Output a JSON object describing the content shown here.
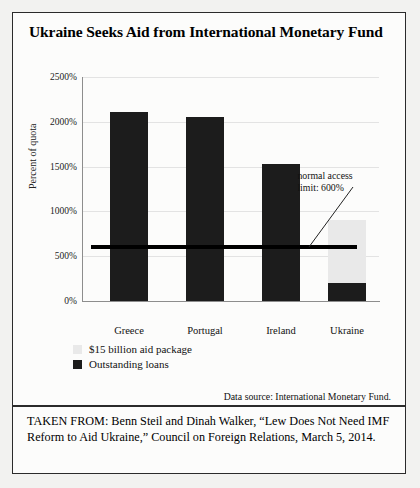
{
  "figure": {
    "title": "Ukraine Seeks Aid from International Monetary Fund",
    "data_source": "Data source: International Monetary Fund.",
    "footer": "TAKEN FROM: Benn Steil and Dinah Walker, “Lew Does Not Need IMF Reform to Aid Ukraine,” Council on Foreign Relations, March 5, 2014."
  },
  "annotation": {
    "line1": "normal access",
    "line2": "limit: 600%"
  },
  "legend": {
    "items": [
      {
        "label": "$15 billion aid package",
        "color": "#e9e9e9",
        "key": "aid"
      },
      {
        "label": "Outstanding loans",
        "color": "#1c1c1c",
        "key": "loans"
      }
    ]
  },
  "chart_data": {
    "type": "bar",
    "stacked": true,
    "title": "Ukraine Seeks Aid from International Monetary Fund",
    "xlabel": "",
    "ylabel": "Percent of quota",
    "ylim": [
      0,
      2500
    ],
    "yticks": [
      0,
      500,
      1000,
      1500,
      2000,
      2500
    ],
    "ytick_labels": [
      "0%",
      "500%",
      "1000%",
      "1500%",
      "2000%",
      "2500%"
    ],
    "grid": true,
    "legend_position": "below-left",
    "categories": [
      "Greece",
      "Portugal",
      "Ireland",
      "Ukraine"
    ],
    "series": [
      {
        "name": "Outstanding loans",
        "color": "#1c1c1c",
        "values": [
          2110,
          2050,
          1530,
          200
        ]
      },
      {
        "name": "$15 billion aid package",
        "color": "#e9e9e9",
        "values": [
          0,
          0,
          0,
          700
        ]
      }
    ],
    "reference_line": {
      "label": "normal access limit: 600%",
      "value": 600,
      "color": "#000000"
    }
  }
}
